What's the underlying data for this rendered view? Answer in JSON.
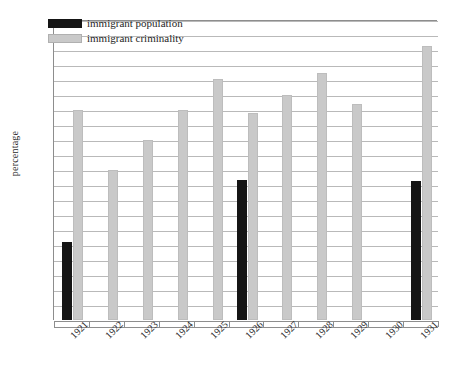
{
  "chart_data": {
    "type": "bar",
    "title": "",
    "xlabel": "",
    "ylabel": "percentage",
    "ylim": [
      0,
      20
    ],
    "ytick_step": 1,
    "grid": true,
    "legend_position": "top-left-inside",
    "categories": [
      "1921",
      "1922",
      "1923",
      "1924",
      "1925",
      "1926",
      "1927",
      "1928",
      "1929",
      "1930",
      "1931"
    ],
    "series": [
      {
        "name": "immigrant population",
        "color": "#151515",
        "values": [
          5.2,
          null,
          null,
          null,
          null,
          9.35,
          null,
          null,
          null,
          null,
          9.3
        ]
      },
      {
        "name": "immigrant criminality",
        "color": "#c9c9c9",
        "values": [
          14.0,
          10.0,
          12.0,
          14.0,
          16.1,
          13.8,
          15.0,
          16.45,
          14.4,
          null,
          18.3
        ]
      }
    ],
    "yticks": [
      "0",
      "1",
      "2",
      "3",
      "4",
      "5",
      "6",
      "7",
      "8",
      "9",
      "10",
      "11",
      "12",
      "13",
      "14",
      "15",
      "16",
      "17",
      "18",
      "19",
      "20"
    ]
  },
  "legend": {
    "entries": [
      {
        "label": "immigrant population"
      },
      {
        "label": "immigrant criminality"
      }
    ]
  },
  "caption": {
    "text": ""
  }
}
